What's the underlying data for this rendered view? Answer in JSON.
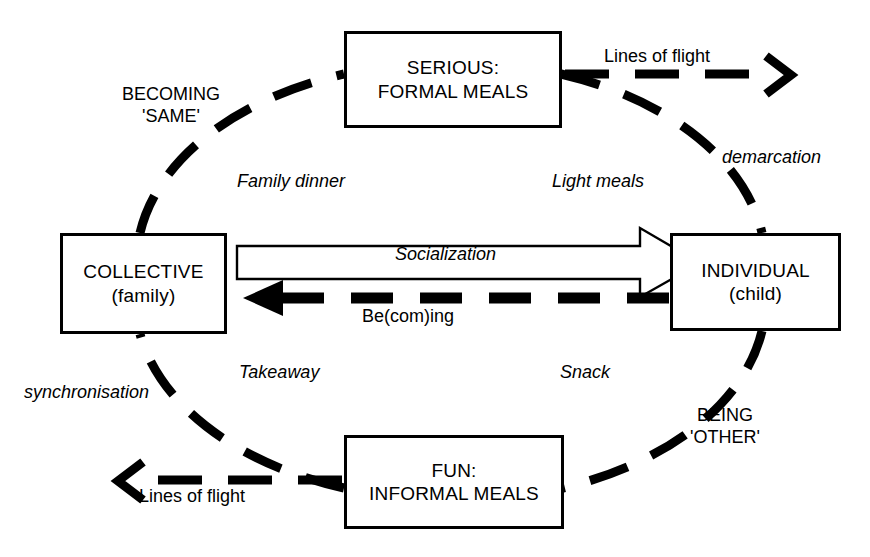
{
  "diagram": {
    "type": "cycle-diagram",
    "nodes": [
      {
        "id": "serious",
        "line1": "SERIOUS:",
        "line2": "FORMAL MEALS",
        "position": "top"
      },
      {
        "id": "collective",
        "line1": "COLLECTIVE",
        "line2": "(family)",
        "position": "left"
      },
      {
        "id": "individual",
        "line1": "INDIVIDUAL",
        "line2": "(child)",
        "position": "right"
      },
      {
        "id": "fun",
        "line1": "FUN:",
        "line2": "INFORMAL MEALS",
        "position": "bottom"
      }
    ],
    "center_arrows": [
      {
        "id": "socialization",
        "label": "Socialization",
        "style": "hollow-block-arrow",
        "direction": "left-to-right",
        "from": "collective",
        "to": "individual"
      },
      {
        "id": "becoming",
        "label": "Be(com)ing",
        "style": "thick-dashed-arrow",
        "direction": "right-to-left",
        "from": "individual",
        "to": "collective"
      }
    ],
    "quadrant_labels": [
      {
        "id": "family-dinner",
        "text": "Family dinner",
        "style": "italic",
        "quadrant": "top-left"
      },
      {
        "id": "light-meals",
        "text": "Light meals",
        "style": "italic",
        "quadrant": "top-right"
      },
      {
        "id": "takeaway",
        "text": "Takeaway",
        "style": "italic",
        "quadrant": "bottom-left"
      },
      {
        "id": "snack",
        "text": "Snack",
        "style": "italic",
        "quadrant": "bottom-right"
      }
    ],
    "arc_labels": [
      {
        "id": "becoming-same",
        "line1": "BECOMING",
        "line2": "'SAME'",
        "style": "caps",
        "arc": "upper-left"
      },
      {
        "id": "demarcation",
        "text": "demarcation",
        "style": "italic",
        "arc": "upper-right"
      },
      {
        "id": "being-other",
        "line1": "BEING",
        "line2": "'OTHER'",
        "style": "caps",
        "arc": "lower-right"
      },
      {
        "id": "synchronisation",
        "text": "synchronisation",
        "style": "italic",
        "arc": "lower-left"
      }
    ],
    "lines_of_flight": [
      {
        "id": "lof-top",
        "text": "Lines of flight",
        "direction": "right",
        "anchor": "serious"
      },
      {
        "id": "lof-bottom",
        "text": "Lines of flight",
        "direction": "left",
        "anchor": "fun"
      }
    ],
    "colors": {
      "stroke": "#000000",
      "background": "#ffffff",
      "fill": "#ffffff"
    }
  }
}
